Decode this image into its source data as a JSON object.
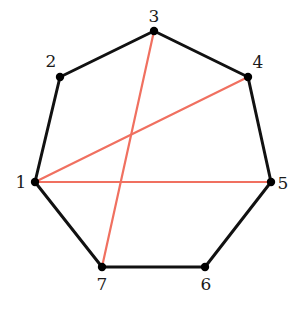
{
  "diagram": {
    "colors": {
      "edge": "#111111",
      "chord": "#f07060",
      "vertex": "#000000"
    },
    "vertices": [
      {
        "id": "1",
        "label": "1",
        "x": 35,
        "y": 182,
        "lx": 21,
        "ly": 188,
        "anchor": "middle"
      },
      {
        "id": "2",
        "label": "2",
        "x": 60,
        "y": 77,
        "lx": 51,
        "ly": 67,
        "anchor": "middle"
      },
      {
        "id": "3",
        "label": "3",
        "x": 154,
        "y": 31,
        "lx": 154,
        "ly": 22,
        "anchor": "middle"
      },
      {
        "id": "4",
        "label": "4",
        "x": 248,
        "y": 77,
        "lx": 258,
        "ly": 68,
        "anchor": "middle"
      },
      {
        "id": "5",
        "label": "5",
        "x": 271,
        "y": 182,
        "lx": 283,
        "ly": 189,
        "anchor": "middle"
      },
      {
        "id": "6",
        "label": "6",
        "x": 205,
        "y": 267,
        "lx": 206,
        "ly": 290,
        "anchor": "middle"
      },
      {
        "id": "7",
        "label": "7",
        "x": 102,
        "y": 267,
        "lx": 102,
        "ly": 290,
        "anchor": "middle"
      }
    ],
    "edges": [
      [
        "1",
        "2"
      ],
      [
        "2",
        "3"
      ],
      [
        "3",
        "4"
      ],
      [
        "4",
        "5"
      ],
      [
        "5",
        "6"
      ],
      [
        "6",
        "7"
      ],
      [
        "7",
        "1"
      ]
    ],
    "chords": [
      [
        "1",
        "4"
      ],
      [
        "1",
        "5"
      ],
      [
        "3",
        "7"
      ]
    ]
  }
}
